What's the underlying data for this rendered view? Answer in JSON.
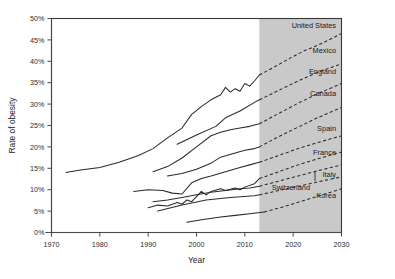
{
  "chart_data": {
    "type": "line",
    "title": "",
    "xlabel": "Year",
    "ylabel": "Rate of obesity",
    "xlim": [
      1970,
      2030
    ],
    "ylim": [
      0,
      50
    ],
    "xticks": [
      1970,
      1980,
      1990,
      2000,
      2010,
      2020,
      2030
    ],
    "xtick_labels": [
      "1970",
      "1980",
      "1990",
      "2000",
      "2010",
      "2020",
      "2030"
    ],
    "yticks": [
      0,
      5,
      10,
      15,
      20,
      25,
      30,
      35,
      40,
      45,
      50
    ],
    "ytick_labels": [
      "0%",
      "5%",
      "10%",
      "15%",
      "20%",
      "25%",
      "30%",
      "35%",
      "40%",
      "45%",
      "50%"
    ],
    "grid": false,
    "legend_position": "inline-right-labels",
    "forecast_region": {
      "start_year": 2013,
      "end_year": 2030,
      "fill_color": "#c9c9c9",
      "note": "shaded projection area"
    },
    "line_style": {
      "historical": "solid",
      "projected": "dashed",
      "color": "#2a2a2a"
    },
    "series": [
      {
        "name": "United States",
        "label": "United States",
        "historical": [
          [
            1973,
            14.0
          ],
          [
            1976,
            14.6
          ],
          [
            1980,
            15.2
          ],
          [
            1984,
            16.4
          ],
          [
            1988,
            18.0
          ],
          [
            1991,
            19.6
          ],
          [
            1994,
            22.1
          ],
          [
            1997,
            24.4
          ],
          [
            1999,
            27.6
          ],
          [
            2001,
            29.4
          ],
          [
            2003,
            31.0
          ],
          [
            2005,
            32.2
          ],
          [
            2006,
            33.9
          ],
          [
            2007,
            32.8
          ],
          [
            2008,
            33.6
          ],
          [
            2009,
            33.0
          ],
          [
            2010,
            34.8
          ],
          [
            2011,
            34.2
          ],
          [
            2012,
            35.4
          ],
          [
            2013,
            36.8
          ]
        ],
        "projected": [
          [
            2013,
            36.8
          ],
          [
            2016,
            38.6
          ],
          [
            2019,
            40.5
          ],
          [
            2022,
            42.3
          ],
          [
            2026,
            44.2
          ],
          [
            2030,
            46.5
          ]
        ]
      },
      {
        "name": "Mexico",
        "label": "Mexico",
        "historical": [
          [
            1996,
            20.6
          ],
          [
            2000,
            22.8
          ],
          [
            2004,
            24.8
          ],
          [
            2006,
            26.8
          ],
          [
            2009,
            28.4
          ],
          [
            2012,
            30.4
          ],
          [
            2013,
            31.0
          ]
        ],
        "projected": [
          [
            2013,
            31.0
          ],
          [
            2017,
            33.2
          ],
          [
            2021,
            35.4
          ],
          [
            2025,
            37.4
          ],
          [
            2030,
            39.4
          ]
        ]
      },
      {
        "name": "England",
        "label": "England",
        "historical": [
          [
            1991,
            14.2
          ],
          [
            1994,
            15.4
          ],
          [
            1997,
            17.4
          ],
          [
            2000,
            20.0
          ],
          [
            2003,
            22.6
          ],
          [
            2005,
            23.4
          ],
          [
            2007,
            24.0
          ],
          [
            2009,
            24.4
          ],
          [
            2011,
            24.8
          ],
          [
            2013,
            25.4
          ]
        ],
        "projected": [
          [
            2013,
            25.4
          ],
          [
            2017,
            27.8
          ],
          [
            2021,
            30.2
          ],
          [
            2025,
            32.4
          ],
          [
            2030,
            34.8
          ]
        ]
      },
      {
        "name": "Canada",
        "label": "Canada",
        "historical": [
          [
            1994,
            13.2
          ],
          [
            1997,
            13.8
          ],
          [
            2000,
            14.8
          ],
          [
            2003,
            16.2
          ],
          [
            2005,
            17.6
          ],
          [
            2008,
            18.6
          ],
          [
            2010,
            19.2
          ],
          [
            2012,
            19.6
          ],
          [
            2013,
            20.0
          ]
        ],
        "projected": [
          [
            2013,
            20.0
          ],
          [
            2017,
            22.4
          ],
          [
            2021,
            24.6
          ],
          [
            2025,
            26.8
          ],
          [
            2030,
            29.2
          ]
        ]
      },
      {
        "name": "Spain",
        "label": "Spain",
        "historical": [
          [
            1987,
            9.6
          ],
          [
            1990,
            10.0
          ],
          [
            1993,
            9.8
          ],
          [
            1995,
            9.2
          ],
          [
            1997,
            9.0
          ],
          [
            1999,
            11.6
          ],
          [
            2001,
            12.6
          ],
          [
            2003,
            13.2
          ],
          [
            2006,
            14.2
          ],
          [
            2009,
            15.2
          ],
          [
            2011,
            15.8
          ],
          [
            2013,
            16.4
          ]
        ],
        "projected": [
          [
            2013,
            16.4
          ],
          [
            2017,
            18.0
          ],
          [
            2021,
            19.6
          ],
          [
            2025,
            21.0
          ],
          [
            2030,
            22.6
          ]
        ]
      },
      {
        "name": "France",
        "label": "France",
        "historical": [
          [
            1990,
            5.8
          ],
          [
            1992,
            6.4
          ],
          [
            1994,
            6.2
          ],
          [
            1996,
            7.0
          ],
          [
            1997,
            6.6
          ],
          [
            1998,
            7.6
          ],
          [
            1999,
            7.2
          ],
          [
            2000,
            8.4
          ],
          [
            2001,
            9.6
          ],
          [
            2002,
            8.8
          ],
          [
            2003,
            9.6
          ],
          [
            2005,
            10.2
          ],
          [
            2006,
            9.8
          ],
          [
            2008,
            10.4
          ],
          [
            2009,
            10.0
          ],
          [
            2010,
            10.6
          ],
          [
            2012,
            11.4
          ],
          [
            2013,
            12.6
          ]
        ],
        "projected": [
          [
            2013,
            12.6
          ],
          [
            2017,
            14.2
          ],
          [
            2021,
            15.8
          ],
          [
            2025,
            17.2
          ],
          [
            2030,
            18.8
          ]
        ]
      },
      {
        "name": "Italy",
        "label": "Italy",
        "historical": [
          [
            1991,
            7.2
          ],
          [
            1994,
            7.6
          ],
          [
            1997,
            8.2
          ],
          [
            2000,
            8.8
          ],
          [
            2003,
            9.4
          ],
          [
            2006,
            9.8
          ],
          [
            2009,
            10.2
          ],
          [
            2011,
            10.4
          ],
          [
            2013,
            10.8
          ]
        ],
        "projected": [
          [
            2013,
            10.8
          ],
          [
            2017,
            12.0
          ],
          [
            2021,
            13.2
          ],
          [
            2025,
            14.4
          ],
          [
            2030,
            15.8
          ]
        ]
      },
      {
        "name": "Switzerland",
        "label": "Switzerland",
        "historical": [
          [
            1992,
            5.0
          ],
          [
            1997,
            6.4
          ],
          [
            2002,
            7.6
          ],
          [
            2007,
            8.2
          ],
          [
            2012,
            8.6
          ],
          [
            2013,
            8.8
          ]
        ],
        "projected": [
          [
            2013,
            8.8
          ],
          [
            2017,
            9.8
          ],
          [
            2021,
            10.8
          ],
          [
            2025,
            11.8
          ],
          [
            2030,
            13.0
          ]
        ],
        "has_leader_line": true
      },
      {
        "name": "Korea",
        "label": "Korea",
        "historical": [
          [
            1998,
            2.4
          ],
          [
            2001,
            3.0
          ],
          [
            2005,
            3.6
          ],
          [
            2008,
            4.0
          ],
          [
            2011,
            4.4
          ],
          [
            2014,
            4.8
          ]
        ],
        "projected": [
          [
            2014,
            4.8
          ],
          [
            2018,
            6.0
          ],
          [
            2022,
            7.4
          ],
          [
            2026,
            8.8
          ],
          [
            2030,
            10.2
          ]
        ]
      }
    ]
  }
}
